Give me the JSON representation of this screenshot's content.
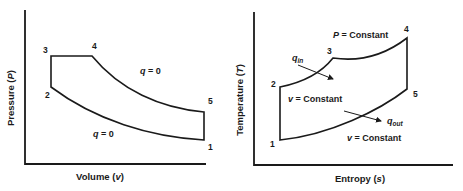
{
  "pv_diagram": {
    "x_axis_label_main": "Volume (",
    "x_axis_label_var": "v",
    "x_axis_label_end": ")",
    "y_axis_label_main": "Pressure (",
    "y_axis_label_var": "P",
    "y_axis_label_end": ")",
    "points": [
      "1",
      "2",
      "3",
      "4",
      "5"
    ],
    "annotations": {
      "upper_q_var": "q",
      "upper_q_rest": " = 0",
      "lower_q_var": "q",
      "lower_q_rest": " = 0"
    }
  },
  "ts_diagram": {
    "x_axis_label_main": "Entropy (",
    "x_axis_label_var": "s",
    "x_axis_label_end": ")",
    "y_axis_label_main": "Temperature (",
    "y_axis_label_var": "T",
    "y_axis_label_end": ")",
    "points": [
      "1",
      "2",
      "3",
      "4",
      "5"
    ],
    "annotations": {
      "p_const_var": "P",
      "p_const_rest": " = Constant",
      "v_const_upper_var": "v",
      "v_const_upper_rest": " = Constant",
      "v_const_lower_var": "v",
      "v_const_lower_rest": " = Constant",
      "q_in_var": "q",
      "q_in_sub": "in",
      "q_out_var": "q",
      "q_out_sub": "out"
    }
  }
}
